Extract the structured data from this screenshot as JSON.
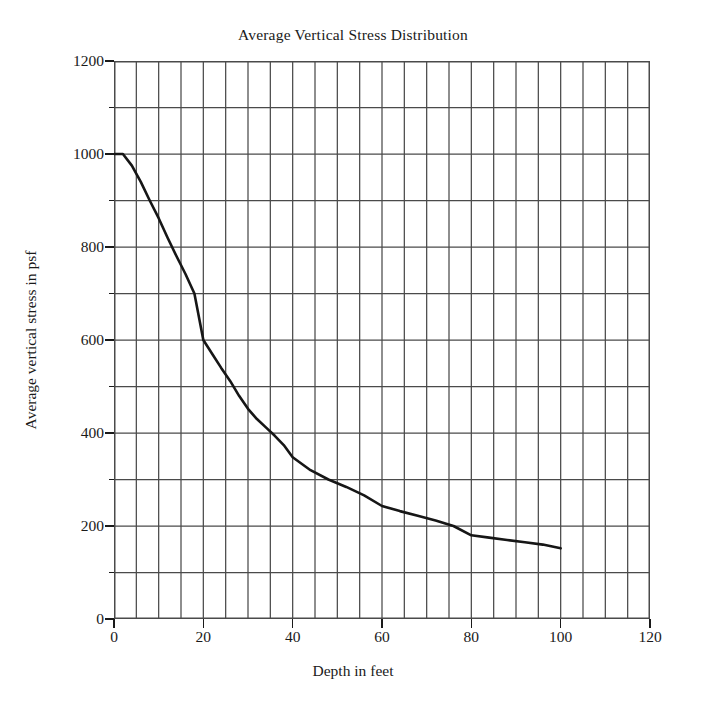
{
  "chart_data": {
    "type": "line",
    "title": "Average Vertical Stress Distribution",
    "xlabel": "Depth in feet",
    "ylabel": "Average vertical stress in psf",
    "xlim": [
      0,
      120
    ],
    "ylim": [
      0,
      1200
    ],
    "x_major_ticks": [
      0,
      20,
      40,
      60,
      80,
      100,
      120
    ],
    "y_major_ticks": [
      0,
      200,
      400,
      600,
      800,
      1000,
      1200
    ],
    "x_tick_labels": [
      "0",
      "20",
      "40",
      "60",
      "80",
      "100",
      "120"
    ],
    "y_tick_labels": [
      "0",
      "200",
      "400",
      "600",
      "800",
      "1000",
      "1200"
    ],
    "x_grid_step": 5,
    "y_grid_step": 100,
    "grid": true,
    "grid_color": "#4a4a4a",
    "line_color": "#161616",
    "line_width": 2.6,
    "background_color": "#ffffff",
    "legend": null,
    "x": [
      0,
      2,
      4,
      6,
      8,
      10,
      12,
      14,
      16,
      18,
      20,
      22,
      24,
      26,
      28,
      30,
      32,
      34,
      36,
      38,
      40,
      44,
      48,
      52,
      56,
      60,
      64,
      68,
      72,
      76,
      80,
      84,
      88,
      92,
      96,
      100
    ],
    "y": [
      1000,
      1000,
      975,
      940,
      900,
      862,
      820,
      780,
      742,
      700,
      600,
      570,
      540,
      512,
      480,
      452,
      430,
      412,
      394,
      374,
      348,
      320,
      300,
      284,
      266,
      243,
      232,
      222,
      212,
      200,
      180,
      175,
      170,
      165,
      160,
      152
    ],
    "series": [
      {
        "name": "Average vertical stress",
        "x": [
          0,
          2,
          4,
          6,
          8,
          10,
          12,
          14,
          16,
          18,
          20,
          22,
          24,
          26,
          28,
          30,
          32,
          34,
          36,
          38,
          40,
          44,
          48,
          52,
          56,
          60,
          64,
          68,
          72,
          76,
          80,
          84,
          88,
          92,
          96,
          100
        ],
        "y": [
          1000,
          1000,
          975,
          940,
          900,
          862,
          820,
          780,
          742,
          700,
          600,
          570,
          540,
          512,
          480,
          452,
          430,
          412,
          394,
          374,
          348,
          320,
          300,
          284,
          266,
          243,
          232,
          222,
          212,
          200,
          180,
          175,
          170,
          165,
          160,
          152
        ]
      }
    ]
  }
}
